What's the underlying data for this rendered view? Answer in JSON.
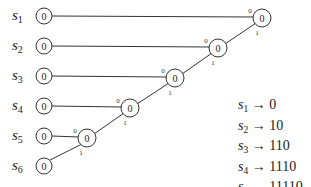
{
  "symbols": [
    {
      "name": "s",
      "index": "1",
      "y": 16
    },
    {
      "name": "s",
      "index": "2",
      "y": 46
    },
    {
      "name": "s",
      "index": "3",
      "y": 76
    },
    {
      "name": "s",
      "index": "4",
      "y": 106
    },
    {
      "name": "s",
      "index": "5",
      "y": 136
    },
    {
      "name": "s",
      "index": "6",
      "y": 166
    }
  ],
  "leaf_node_label": "0",
  "internal_node_label": "0",
  "edge_label_upper": "0",
  "edge_label_lower": "1",
  "codes": [
    {
      "symbol": "s",
      "index": "1",
      "arrow": "→",
      "code": "0"
    },
    {
      "symbol": "s",
      "index": "2",
      "arrow": "→",
      "code": "10"
    },
    {
      "symbol": "s",
      "index": "3",
      "arrow": "→",
      "code": "110"
    },
    {
      "symbol": "s",
      "index": "4",
      "arrow": "→",
      "code": "1110"
    },
    {
      "symbol": "s",
      "index": "5",
      "arrow": "→",
      "code": "11110"
    },
    {
      "symbol": "s",
      "index": "6",
      "arrow": "→",
      "code": "11111"
    }
  ]
}
